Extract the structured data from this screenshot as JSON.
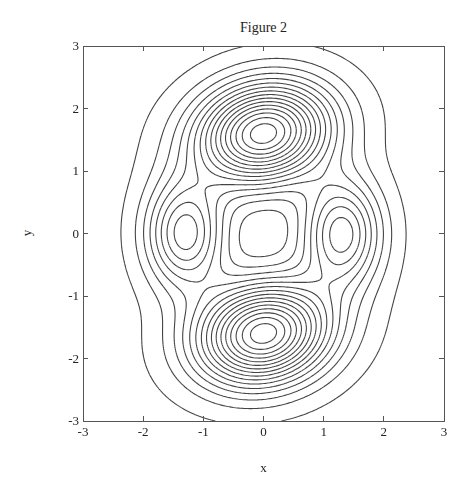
{
  "chart_data": {
    "type": "contour",
    "title": "Figure 2",
    "xlabel": "x",
    "ylabel": "y",
    "xlim": [
      -3,
      3
    ],
    "ylim": [
      -3,
      3
    ],
    "xticks": [
      -3,
      -2,
      -1,
      0,
      1,
      2,
      3
    ],
    "yticks": [
      -3,
      -2,
      -1,
      0,
      1,
      2,
      3
    ],
    "grid": false,
    "legend": null,
    "line_color": "#444444",
    "peaks": [
      {
        "name": "top",
        "x": 0.0,
        "y": 1.6,
        "amplitude": 1.0,
        "sx": 0.75,
        "sy": 0.55
      },
      {
        "name": "bottom",
        "x": 0.0,
        "y": -1.6,
        "amplitude": 1.0,
        "sx": 0.75,
        "sy": 0.55
      },
      {
        "name": "left",
        "x": -1.3,
        "y": 0.0,
        "amplitude": 0.5,
        "sx": 0.45,
        "sy": 0.6
      },
      {
        "name": "right",
        "x": 1.3,
        "y": 0.0,
        "amplitude": 0.5,
        "sx": 0.45,
        "sy": 0.6
      }
    ],
    "tilt": 0.18,
    "contour_levels": 16,
    "level_min": 0.03,
    "level_max": 0.96
  }
}
